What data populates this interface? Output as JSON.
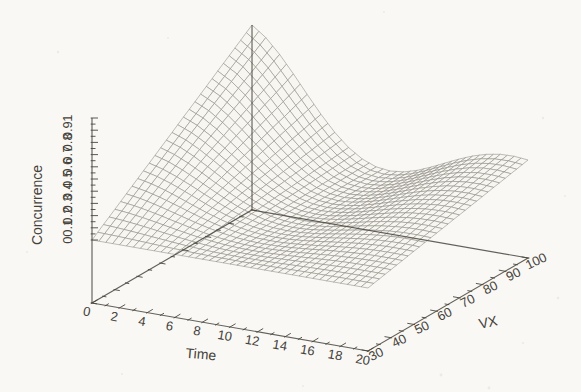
{
  "chart_data": {
    "type": "surface",
    "title": "",
    "xlabel": "Time",
    "ylabel": "VX",
    "zlabel": "Concurrence",
    "x_range": [
      0,
      20
    ],
    "y_range": [
      30,
      100
    ],
    "z_range": [
      0,
      1
    ],
    "x_tick_labels": [
      "0",
      "2",
      "4",
      "6",
      "8",
      "10",
      "12",
      "14",
      "16",
      "18",
      "20"
    ],
    "x_minor_tick_step": 1,
    "y_tick_labels": [
      "30",
      "40",
      "50",
      "60",
      "70",
      "80",
      "90",
      "100"
    ],
    "y_minor_tick_step": 5,
    "z_tick_labels": [
      "0",
      "0.1",
      "0.2",
      "0.3",
      "0.4",
      "0.5",
      "0.6",
      "0.7",
      "0.8",
      "0.9",
      "1"
    ],
    "z_minor_tick_step": 0.05,
    "grid": false,
    "legend": "none",
    "surface": {
      "description": "Wireframe mesh surface. Concurrence is separable: C(t,vx) = vx_amplitude(vx) * time_profile(t). Starts at maximum at Time=0 (rising linearly with VX from 0 at VX=30 to 1 at VX=100), decays to 0 near Time=10, partially revives to about 0.3 by Time=17-20 at large VX.",
      "time_values": [
        0,
        1,
        2,
        3,
        4,
        5,
        6,
        7,
        8,
        9,
        10,
        11,
        12,
        13,
        14,
        15,
        16,
        17,
        18,
        19,
        20
      ],
      "time_profile": [
        1,
        0.9164,
        0.7983,
        0.6581,
        0.5097,
        0.3658,
        0.2374,
        0.1331,
        0.0579,
        0.0139,
        0,
        0.0123,
        0.0451,
        0.0915,
        0.144,
        0.1958,
        0.2408,
        0.2744,
        0.2937,
        0.2975,
        0.2865
      ],
      "vx_values": [
        30,
        35,
        40,
        45,
        50,
        55,
        60,
        65,
        70,
        75,
        80,
        85,
        90,
        95,
        100
      ],
      "vx_amplitude": [
        0,
        0.0714,
        0.1429,
        0.2143,
        0.2857,
        0.3571,
        0.4286,
        0.5,
        0.5714,
        0.6429,
        0.7143,
        0.7857,
        0.8571,
        0.9286,
        1
      ],
      "peak": {
        "time": 0,
        "vx": 100,
        "concurrence": 1.0
      },
      "valley": {
        "time": 10,
        "concurrence": 0.0
      },
      "revival_peak": {
        "time": 19,
        "vx": 100,
        "concurrence": 0.3
      }
    }
  },
  "colors": {
    "paper": "#f9f8f5",
    "mesh_line": "#8b8880",
    "mesh_fill": "#f7f6f1",
    "axis_line": "#4a473e",
    "text": "#45423a"
  }
}
